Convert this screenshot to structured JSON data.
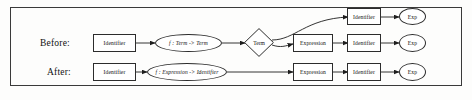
{
  "diagram": {
    "border_color": "#3a3a3a",
    "node_stroke": "#2c2c2c",
    "background": "#fdfdfc",
    "rows": [
      {
        "id": "before",
        "label": "Before:"
      },
      {
        "id": "after",
        "label": "After:"
      }
    ],
    "nodes": {
      "before_identifier": "Identifier",
      "before_function": "f : Term -> Term",
      "before_decision": "Term",
      "before_expression": "Expression",
      "top_identifier": "Identifier",
      "top_exp": "Exp",
      "mid_identifier": "Identifier",
      "mid_exp": "Exp",
      "after_identifier": "Identifier",
      "after_function": "f : Expression -> Identifier",
      "after_expression": "Expression",
      "after_identifier2": "Identifier",
      "after_exp": "Exp"
    }
  }
}
